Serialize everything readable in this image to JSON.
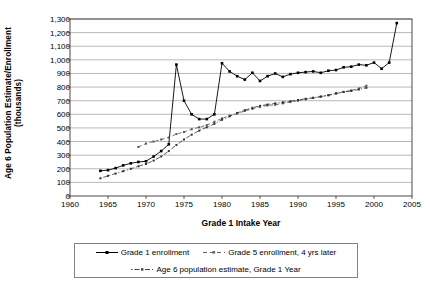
{
  "chart_data": {
    "type": "line",
    "title": "",
    "subtitle": "",
    "xlabel": "Grade 1 Intake Year",
    "ylabel": "Age 6 Population Estimate/Enrollment (thousands)",
    "ylabel_line1": "Age 6 Population Estimate/Enrollment",
    "ylabel_line2": "(thousands)",
    "xlim": [
      1960,
      2005
    ],
    "ylim": [
      0,
      1300
    ],
    "xticks": [
      1960,
      1965,
      1970,
      1975,
      1980,
      1985,
      1990,
      1995,
      2000,
      2005
    ],
    "yticks": [
      0,
      100,
      200,
      300,
      400,
      500,
      600,
      700,
      800,
      900,
      1000,
      1100,
      1200,
      1300
    ],
    "ytick_labels": [
      "0",
      "100",
      "200",
      "300",
      "400",
      "500",
      "600",
      "700",
      "800",
      "900",
      "1,000",
      "1,100",
      "1,200",
      "1,300"
    ],
    "xtick_labels": [
      "1960",
      "1965",
      "1970",
      "1975",
      "1980",
      "1985",
      "1990",
      "1995",
      "2000",
      "2005"
    ],
    "grid": "horizontal",
    "legend_position": "bottom",
    "series": [
      {
        "name": "Grade 1 enrollment",
        "style": "solid",
        "marker": "square",
        "color": "#000000",
        "x": [
          1964,
          1965,
          1966,
          1967,
          1968,
          1969,
          1970,
          1971,
          1972,
          1973,
          1974,
          1975,
          1976,
          1977,
          1978,
          1979,
          1980,
          1981,
          1982,
          1983,
          1984,
          1985,
          1986,
          1987,
          1988,
          1989,
          1990,
          1991,
          1992,
          1993,
          1994,
          1995,
          1996,
          1997,
          1998,
          1999,
          2000,
          2001,
          2002,
          2003
        ],
        "values": [
          185,
          190,
          205,
          225,
          240,
          250,
          255,
          290,
          330,
          380,
          965,
          700,
          600,
          565,
          565,
          600,
          975,
          915,
          880,
          855,
          905,
          845,
          880,
          900,
          875,
          895,
          905,
          910,
          915,
          905,
          920,
          925,
          945,
          950,
          965,
          960,
          980,
          935,
          980,
          1270
        ]
      },
      {
        "name": "Grade 5 enrollment, 4 yrs later",
        "style": "dashed",
        "marker": "square",
        "color": "#555555",
        "x": [
          1969,
          1970,
          1971,
          1972,
          1973,
          1974,
          1975,
          1976,
          1977,
          1978,
          1979,
          1980,
          1981,
          1982,
          1983,
          1984,
          1985,
          1986,
          1987,
          1988,
          1989,
          1990,
          1991,
          1992,
          1993,
          1994,
          1995,
          1996,
          1997,
          1998,
          1999
        ],
        "values": [
          360,
          385,
          400,
          415,
          430,
          455,
          470,
          490,
          505,
          520,
          545,
          570,
          590,
          605,
          625,
          640,
          655,
          665,
          670,
          680,
          690,
          700,
          710,
          720,
          730,
          740,
          755,
          765,
          775,
          790,
          810
        ]
      },
      {
        "name": "Age 6 population estimate, Grade 1 Year",
        "style": "dashdot",
        "marker": "square",
        "color": "#333333",
        "x": [
          1964,
          1965,
          1966,
          1967,
          1968,
          1969,
          1970,
          1971,
          1972,
          1973,
          1974,
          1975,
          1976,
          1977,
          1978,
          1979,
          1980,
          1981,
          1982,
          1983,
          1984,
          1985,
          1986,
          1987,
          1988,
          1989,
          1990,
          1991,
          1992,
          1993,
          1994,
          1995,
          1996,
          1997,
          1998,
          1999
        ],
        "values": [
          130,
          148,
          165,
          182,
          200,
          218,
          235,
          260,
          290,
          330,
          375,
          415,
          450,
          480,
          505,
          530,
          560,
          585,
          610,
          630,
          648,
          662,
          672,
          680,
          688,
          696,
          705,
          714,
          722,
          730,
          740,
          752,
          764,
          772,
          782,
          795
        ]
      }
    ]
  },
  "legend": {
    "items": [
      {
        "label": "Grade 1 enrollment"
      },
      {
        "label": "Grade 5 enrollment, 4 yrs later"
      },
      {
        "label": "Age 6 population estimate, Grade 1 Year"
      }
    ]
  }
}
